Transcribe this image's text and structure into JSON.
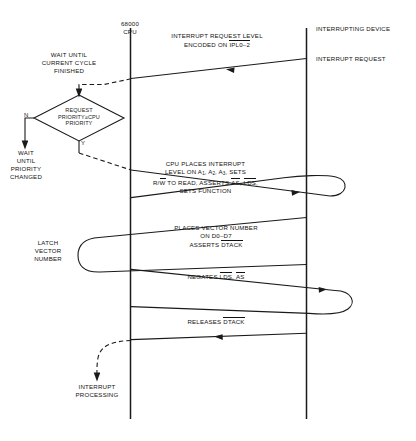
{
  "diagram": {
    "lifelines": [
      {
        "name": "cpu",
        "label_line1": "68000",
        "label_line2": "CPU"
      },
      {
        "name": "device",
        "label": "INTERRUPTING DEVICE"
      }
    ],
    "cpu_steps": {
      "wait_cycle": "WAIT UNTIL\nCURRENT CYCLE\nFINISHED",
      "wait_cycle_l1": "WAIT UNTIL",
      "wait_cycle_l2": "CURRENT CYCLE",
      "wait_cycle_l3": "FINISHED",
      "decision_l1": "REQUEST",
      "decision_l2a": "PRIORITY",
      "decision_l2b": "≥",
      "decision_l2c": "CPU",
      "decision_l3": "PRIORITY",
      "decision_no": "N",
      "decision_yes": "Y",
      "wait_priority_l1": "WAIT",
      "wait_priority_l2": "UNTIL",
      "wait_priority_l3": "PRIORITY",
      "wait_priority_l4": "CHANGED",
      "latch_l1": "LATCH",
      "latch_l2": "VECTOR",
      "latch_l3": "NUMBER",
      "end_l1": "INTERRUPT",
      "end_l2": "PROCESSING"
    },
    "messages": {
      "m1_l1": "INTERRUPT REQUEST LEVEL",
      "m1_l2_pre": "ENCODED ON ",
      "m1_l2_signal": "IPL0–2",
      "m2_l1": "CPU PLACES INTERRUPT",
      "m2_l2_pre": "LEVEL ON A",
      "m2_l2_s1": "1",
      "m2_l2_mid1": ", A",
      "m2_l2_s2": "2",
      "m2_l2_mid2": ", A",
      "m2_l2_s3": "3",
      "m2_l2_post": ", SETS",
      "m2_l3_a": "R/",
      "m2_l3_wbar": "W",
      "m2_l3_b": " TO READ, ASSERTS ",
      "m2_l3_as": "AS",
      "m2_l3_c": ", ",
      "m2_l3_lds": "LDS",
      "m2_l3_d": ",",
      "m2_l4": "SETS FUNCTION",
      "m3_l1": "PLACES VECTOR NUMBER",
      "m3_l2": "ON D0–D7",
      "m3_l3_pre": "ASSERTS ",
      "m3_l3_signal": "DTACK",
      "m4_pre": "NEGATES ",
      "m4_s1": "LDS",
      "m4_mid": ", ",
      "m4_s2": "AS",
      "m5_pre": "RELEASES ",
      "m5_signal": "DTACK"
    },
    "device_steps": {
      "interrupt_request": "INTERRUPT REQUEST"
    },
    "colors": {
      "line": "#1a1a1a",
      "text": "#111111",
      "background": "#ffffff"
    }
  }
}
